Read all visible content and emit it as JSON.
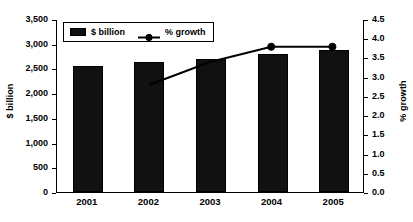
{
  "chart_data": {
    "type": "bar",
    "title": "",
    "subtitle": "",
    "xlabel": "",
    "categories": [
      "2001",
      "2002",
      "2003",
      "2004",
      "2005"
    ],
    "grid": false,
    "legend_position": "top-left-inside",
    "axes": {
      "left": {
        "label": "$ billion",
        "ylim": [
          0,
          3500
        ],
        "tick_step": 500,
        "ticks": [
          "0",
          "500",
          "1,000",
          "1,500",
          "2,000",
          "2,500",
          "3,000",
          "3,500"
        ],
        "tick_values": [
          0,
          500,
          1000,
          1500,
          2000,
          2500,
          3000,
          3500
        ]
      },
      "right": {
        "label": "% growth",
        "ylim": [
          0,
          4.5
        ],
        "tick_step": 0.5,
        "ticks": [
          "0.0",
          "0.5",
          "1.0",
          "1.5",
          "2.0",
          "2.5",
          "3.0",
          "3.5",
          "4.0",
          "4.5"
        ],
        "tick_values": [
          0,
          0.5,
          1.0,
          1.5,
          2.0,
          2.5,
          3.0,
          3.5,
          4.0,
          4.5
        ]
      }
    },
    "series": [
      {
        "name": "$ billion",
        "type": "bar",
        "axis": "left",
        "color": "#111111",
        "values": [
          2550,
          2630,
          2690,
          2790,
          2880
        ]
      },
      {
        "name": "% growth",
        "type": "line",
        "axis": "right",
        "color": "#000000",
        "marker": "circle",
        "values": [
          null,
          2.8,
          3.4,
          3.8,
          3.8
        ]
      }
    ]
  },
  "legend": {
    "items": [
      {
        "label": "$ billion",
        "marker": "filled-rect",
        "color": "#111111"
      },
      {
        "label": "% growth",
        "marker": "line-circle",
        "color": "#000000"
      }
    ]
  }
}
